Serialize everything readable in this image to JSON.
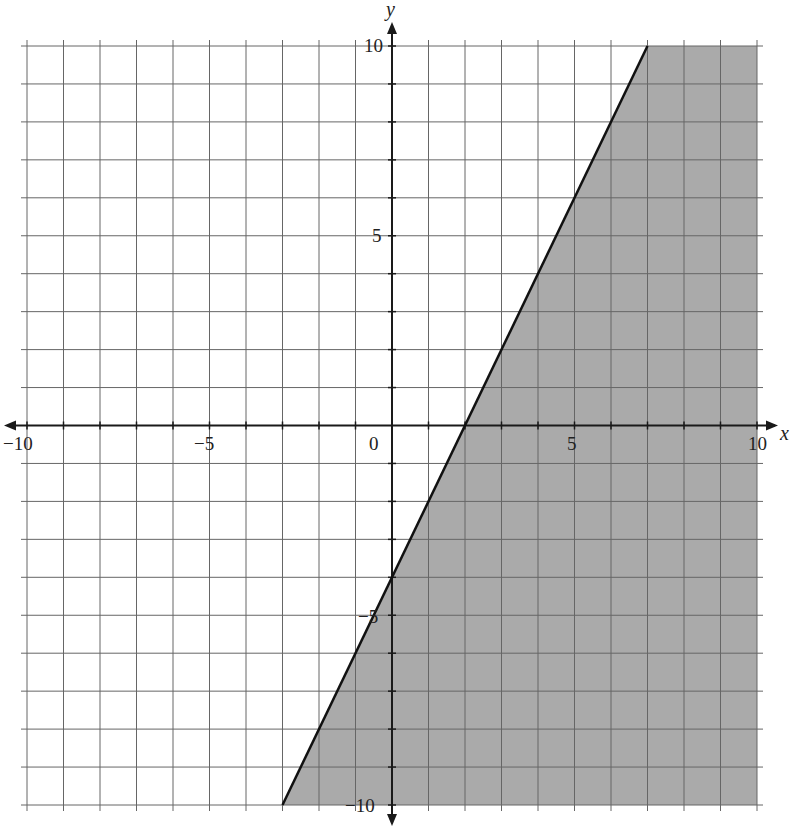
{
  "chart_data": {
    "type": "line",
    "title": "",
    "subtitle": "",
    "xlabel": "x",
    "ylabel": "y",
    "xlim": [
      -10,
      10
    ],
    "ylim": [
      -10,
      10
    ],
    "grid": true,
    "grid_step": 1,
    "legend": null,
    "x_tick_labels": [
      {
        "value": -10,
        "label": "−10"
      },
      {
        "value": -5,
        "label": "−5"
      },
      {
        "value": 0,
        "label": "0"
      },
      {
        "value": 5,
        "label": "5"
      },
      {
        "value": 10,
        "label": "10"
      }
    ],
    "y_tick_labels": [
      {
        "value": 10,
        "label": "10"
      },
      {
        "value": 5,
        "label": "5"
      },
      {
        "value": -5,
        "label": "−5"
      },
      {
        "value": -10,
        "label": "−10"
      }
    ],
    "series": [
      {
        "name": "boundary line y = 2x − 4",
        "style": "solid",
        "points": [
          [
            -3,
            -10
          ],
          [
            7,
            10
          ]
        ]
      }
    ],
    "shaded_region": {
      "description": "y ≤ 2x − 4 (region right of/below the line)",
      "polygon": [
        [
          -3,
          -10
        ],
        [
          7,
          10
        ],
        [
          10,
          10
        ],
        [
          10,
          -10
        ]
      ],
      "color": "#aaaaaa"
    },
    "annotations": {
      "x_intercept": [
        2,
        0
      ],
      "y_intercept": [
        0,
        -4
      ]
    }
  },
  "labels": {
    "x_axis_name": "x",
    "y_axis_name": "y",
    "origin": "0",
    "x_neg10": "−10",
    "x_neg5": "−5",
    "x_5": "5",
    "x_10": "10",
    "y_10": "10",
    "y_5": "5",
    "y_neg5": "−5",
    "y_neg10": "−10"
  },
  "colors": {
    "shade": "#aaaaaa",
    "grid": "#666666",
    "axis": "#1a1a1a",
    "line": "#111111"
  }
}
